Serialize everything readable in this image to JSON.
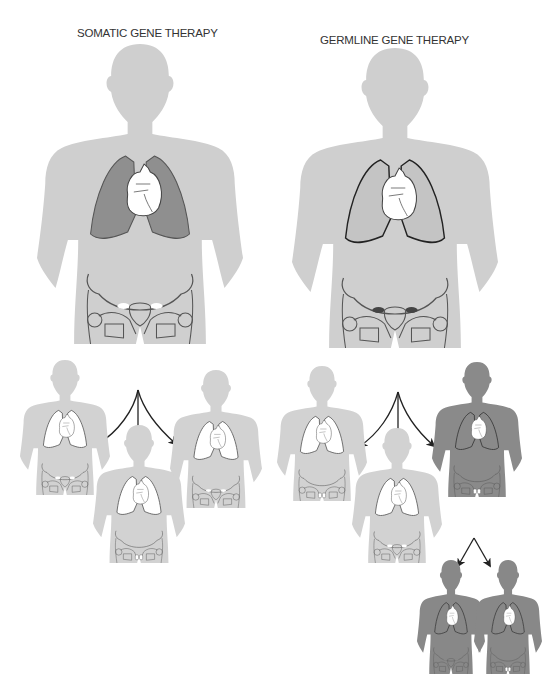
{
  "panels": {
    "somatic": {
      "title": "SOMATIC GENE THERAPY",
      "parent_body_color": "#cfcfcf",
      "treated_organ": "lungs",
      "treated_organ_color": "#8f8f8f",
      "offspring": [
        {
          "position": "left",
          "treated": false
        },
        {
          "position": "center",
          "treated": false
        },
        {
          "position": "right",
          "treated": false
        }
      ]
    },
    "germline": {
      "title": "GERMLINE GENE THERAPY",
      "parent_body_color": "#cfcfcf",
      "treated_organ": "gonads",
      "treated_organ_color": "#555555",
      "offspring": [
        {
          "position": "left",
          "treated": false
        },
        {
          "position": "center",
          "treated": false
        },
        {
          "position": "right",
          "treated": true,
          "color": "#8a8a8a",
          "offspring": [
            {
              "position": "left",
              "treated": true
            },
            {
              "position": "right",
              "treated": true
            }
          ]
        }
      ]
    }
  },
  "colors": {
    "untreated_body": "#d2d2d2",
    "treated_body": "#8c8c8c",
    "arrow": "#222222",
    "outline": "#333333"
  }
}
